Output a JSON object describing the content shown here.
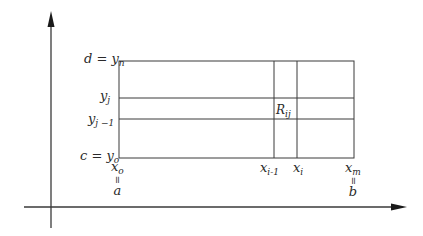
{
  "figure": {
    "colors": {
      "line": "#3a3a3a",
      "background": "#ffffff",
      "text": "#2a2a2a"
    },
    "axes": {
      "y_axis": {
        "x": 51,
        "y_top": 11,
        "y_bottom": 228
      },
      "x_axis": {
        "y": 207,
        "x_left": 24,
        "x_right": 407
      }
    },
    "rectangle": {
      "left": 119,
      "right": 354,
      "top": 61,
      "bottom": 158
    },
    "grid_lines": {
      "horizontal": [
        {
          "name": "y_j",
          "y": 98
        },
        {
          "name": "y_j-1",
          "y": 119
        }
      ],
      "vertical": [
        {
          "name": "x_i-1",
          "x": 274
        },
        {
          "name": "x_i",
          "x": 297
        }
      ]
    }
  },
  "labels": {
    "y_top": {
      "main": "d = y",
      "sub": "n"
    },
    "y_j": {
      "main": "y",
      "sub": "j"
    },
    "y_j_minus_1": {
      "main": "y",
      "sub": "j −1"
    },
    "y_bottom": {
      "main": "c = y",
      "sub": "o"
    },
    "x_0": {
      "main": "x",
      "sub": "o",
      "eq": "=",
      "alias": "a"
    },
    "x_i_minus_1": {
      "main": "x",
      "sub": "i-1"
    },
    "x_i": {
      "main": "x",
      "sub": "i"
    },
    "x_m": {
      "main": "x",
      "sub": "m",
      "eq": "=",
      "alias": "b"
    },
    "region": {
      "main": "R",
      "sub": "ij"
    }
  }
}
